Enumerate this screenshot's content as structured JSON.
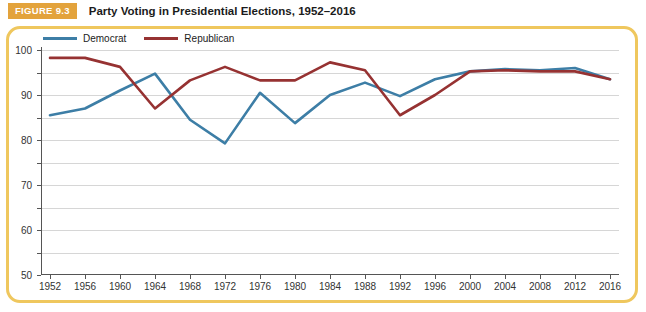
{
  "figure": {
    "badge": "FIGURE 9.3",
    "title": "Party Voting in Presidential Elections, 1952–2016"
  },
  "colors": {
    "democrat": "#3d7ea6",
    "republican": "#963232",
    "badge_background": "#e3a33c",
    "panel_border": "#efc75e",
    "gridline": "#d6d6d6",
    "axis": "#555555"
  },
  "legend": {
    "position": "top-left",
    "items": [
      {
        "label": "Democrat",
        "color": "#3d7ea6"
      },
      {
        "label": "Republican",
        "color": "#963232"
      }
    ]
  },
  "chart_data": {
    "type": "line",
    "title": "Party Voting in Presidential Elections, 1952–2016",
    "xlabel": "",
    "ylabel": "",
    "grid": true,
    "legend_position": "top-left",
    "xlim": [
      1952,
      2016
    ],
    "ylim": [
      0,
      100
    ],
    "ytick_step": 10,
    "yticks": [
      0,
      10,
      20,
      30,
      40,
      50,
      60,
      70,
      80,
      90,
      100
    ],
    "categories": [
      "1952",
      "1956",
      "1960",
      "1964",
      "1968",
      "1972",
      "1976",
      "1980",
      "1984",
      "1988",
      "1992",
      "1996",
      "2000",
      "2004",
      "2008",
      "2012",
      "2016"
    ],
    "series": [
      {
        "name": "Democrat",
        "color": "#3d7ea6",
        "values": [
          71,
          74,
          82,
          89.5,
          69,
          58.5,
          81,
          67.5,
          80,
          85.5,
          79.5,
          87,
          90.5,
          91.5,
          91,
          92,
          87
        ]
      },
      {
        "name": "Republican",
        "color": "#963232",
        "values": [
          96.5,
          96.5,
          92.5,
          74,
          86.5,
          92.5,
          86.5,
          86.5,
          94.5,
          91,
          71,
          80,
          90.5,
          91,
          90.5,
          90.5,
          87
        ]
      }
    ]
  }
}
